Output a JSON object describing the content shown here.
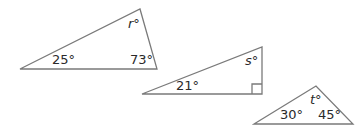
{
  "diagram": {
    "stroke_color": "#7a7a7a",
    "label_color": "#2a2a2a",
    "triangles": [
      {
        "id": "triangle-1",
        "vertices": [
          [
            20,
            69
          ],
          [
            140,
            9
          ],
          [
            157,
            69
          ]
        ],
        "labels": {
          "left_angle": "25°",
          "right_angle": "73°",
          "top_angle_var": "r",
          "top_angle_deg": "°"
        }
      },
      {
        "id": "triangle-2",
        "vertices": [
          [
            142,
            94
          ],
          [
            262,
            47
          ],
          [
            262,
            94
          ]
        ],
        "right_angle_marker": true,
        "labels": {
          "left_angle": "21°",
          "top_angle_var": "s",
          "top_angle_deg": "°"
        }
      },
      {
        "id": "triangle-3",
        "vertices": [
          [
            254,
            124
          ],
          [
            316,
            86
          ],
          [
            353,
            124
          ]
        ],
        "labels": {
          "left_angle": "30°",
          "right_angle": "45°",
          "top_angle_var": "t",
          "top_angle_deg": "°"
        }
      }
    ]
  }
}
